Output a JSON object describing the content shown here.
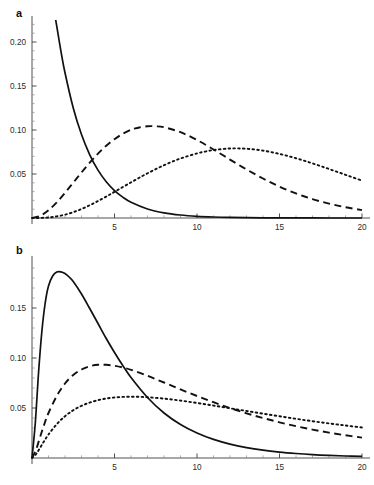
{
  "figure": {
    "width": 374,
    "height": 485,
    "background": "#ffffff",
    "curve_color": "#111111",
    "axis_color": "#3d3d3d"
  },
  "panels": {
    "a": {
      "label": "a"
    },
    "b": {
      "label": "b"
    }
  },
  "chart_data": [
    {
      "type": "line",
      "title": "a",
      "xlabel": "",
      "ylabel": "",
      "xlim": [
        0,
        20
      ],
      "ylim": [
        0,
        0.225
      ],
      "grid": false,
      "legend": "none",
      "xticks": [
        5,
        10,
        15,
        20
      ],
      "xticklabels": [
        "5",
        "10",
        "15",
        "20"
      ],
      "yticks": [
        0.05,
        0.1,
        0.15,
        0.2
      ],
      "yticklabels": [
        "0.05",
        "0.10",
        "0.15",
        "0.20"
      ],
      "x_minor_step": 1,
      "y_minor_step": 0.01,
      "series": [
        {
          "name": "solid",
          "style": "solid",
          "x": [
            0,
            0.25,
            0.5,
            0.75,
            1,
            1.25,
            1.4,
            1.5,
            1.75,
            2,
            2.5,
            3,
            3.5,
            4,
            4.5,
            5,
            5.5,
            6,
            7,
            8,
            9,
            10,
            11,
            12,
            13,
            14,
            15,
            16,
            17,
            18,
            19,
            20
          ],
          "y": [
            0.5,
            0.435,
            0.379,
            0.33,
            0.287,
            0.25,
            0.2295,
            0.218,
            0.19,
            0.165,
            0.125,
            0.0948,
            0.0718,
            0.0544,
            0.0412,
            0.0312,
            0.0237,
            0.0179,
            0.0103,
            0.0059,
            0.0034,
            0.00195,
            0.00112,
            0.00064,
            0.00037,
            0.00021,
            0.00012,
            7e-05,
            4e-05,
            2e-05,
            1e-05,
            1e-05
          ],
          "clipped_at_top": true,
          "visible_start_x": 1.4,
          "visible_start_y": 0.2135
        },
        {
          "name": "dashed",
          "style": "dashed",
          "x": [
            0,
            0.5,
            1,
            1.5,
            2,
            2.5,
            3,
            3.5,
            4,
            4.5,
            5,
            5.5,
            6,
            6.2,
            6.5,
            7,
            7.5,
            8,
            9,
            10,
            11,
            12,
            13,
            14,
            15,
            16,
            17,
            18,
            19,
            20
          ],
          "y": [
            0.0,
            0.0025,
            0.0088,
            0.0178,
            0.0286,
            0.0401,
            0.0518,
            0.0629,
            0.0731,
            0.0821,
            0.0896,
            0.0957,
            0.1003,
            0.1015,
            0.1029,
            0.1042,
            0.1042,
            0.1031,
            0.0975,
            0.0886,
            0.0779,
            0.0664,
            0.0552,
            0.0449,
            0.0357,
            0.0279,
            0.0215,
            0.0163,
            0.0122,
            0.009
          ],
          "peak_x": 6.1,
          "peak_y": 0.1136
        },
        {
          "name": "dotted",
          "style": "dotted",
          "x": [
            0,
            0.5,
            1,
            1.5,
            2,
            2.5,
            3,
            3.5,
            4,
            4.5,
            5,
            6,
            7,
            8,
            9,
            10,
            10.5,
            11,
            12,
            13,
            14,
            15,
            16,
            17,
            18,
            19,
            20
          ],
          "y": [
            0.0,
            0.0001,
            0.0006,
            0.0018,
            0.0038,
            0.0066,
            0.0102,
            0.0145,
            0.0193,
            0.0244,
            0.0297,
            0.0405,
            0.0508,
            0.06,
            0.0676,
            0.0734,
            0.0755,
            0.0772,
            0.079,
            0.0787,
            0.0766,
            0.0728,
            0.0679,
            0.0621,
            0.0557,
            0.0491,
            0.0425
          ],
          "peak_x": 10.3,
          "peak_y": 0.0886
        }
      ]
    },
    {
      "type": "line",
      "title": "b",
      "xlabel": "",
      "ylabel": "",
      "xlim": [
        0,
        20
      ],
      "ylim": [
        0,
        0.198
      ],
      "grid": false,
      "legend": "none",
      "xticks": [
        5,
        10,
        15,
        20
      ],
      "xticklabels": [
        "5",
        "10",
        "15",
        "20"
      ],
      "yticks": [
        0.05,
        0.1,
        0.15
      ],
      "yticklabels": [
        "0.05",
        "0.10",
        "0.15"
      ],
      "x_minor_step": 1,
      "y_minor_step": 0.01,
      "series": [
        {
          "name": "solid",
          "style": "solid",
          "x": [
            0,
            0.2,
            0.4,
            0.6,
            0.8,
            1,
            1.25,
            1.5,
            1.75,
            2,
            2.25,
            2.5,
            3,
            3.5,
            4,
            4.5,
            5,
            5.5,
            6,
            7,
            8,
            9,
            10,
            11,
            12,
            13,
            14,
            15,
            16,
            17,
            18,
            19,
            20
          ],
          "y": [
            0.0,
            0.035,
            0.086,
            0.127,
            0.155,
            0.172,
            0.182,
            0.186,
            0.1862,
            0.1845,
            0.181,
            0.1765,
            0.164,
            0.1495,
            0.1345,
            0.1195,
            0.1055,
            0.0925,
            0.0805,
            0.0605,
            0.045,
            0.0335,
            0.025,
            0.0186,
            0.0139,
            0.0104,
            0.0078,
            0.0059,
            0.0045,
            0.0034,
            0.0026,
            0.002,
            0.0016
          ],
          "peak_x": 1.85,
          "peak_y": 0.1862
        },
        {
          "name": "dashed",
          "style": "dashed",
          "x": [
            0,
            0.25,
            0.5,
            0.75,
            1,
            1.5,
            2,
            2.5,
            3,
            3.5,
            4,
            4.5,
            5,
            5.5,
            6,
            7,
            8,
            9,
            10,
            11,
            12,
            13,
            14,
            15,
            16,
            17,
            18,
            19,
            20
          ],
          "y": [
            0.0,
            0.0085,
            0.0215,
            0.034,
            0.045,
            0.062,
            0.0745,
            0.083,
            0.0885,
            0.0918,
            0.0932,
            0.0932,
            0.0922,
            0.0905,
            0.0882,
            0.0822,
            0.0755,
            0.0686,
            0.062,
            0.0558,
            0.05,
            0.0447,
            0.04,
            0.0357,
            0.0318,
            0.0284,
            0.0254,
            0.0227,
            0.0204
          ],
          "peak_x": 4.2,
          "peak_y": 0.0932
        },
        {
          "name": "dotted",
          "style": "dotted",
          "x": [
            0,
            0.25,
            0.5,
            0.75,
            1,
            1.5,
            2,
            2.5,
            3,
            3.5,
            4,
            4.5,
            5,
            5.5,
            6,
            6.5,
            7,
            8,
            9,
            10,
            11,
            12,
            13,
            14,
            15,
            16,
            17,
            18,
            19,
            20
          ],
          "y": [
            0.0,
            0.004,
            0.0105,
            0.0172,
            0.0235,
            0.0338,
            0.0418,
            0.0478,
            0.0522,
            0.0554,
            0.0578,
            0.0595,
            0.0605,
            0.0611,
            0.0613,
            0.0612,
            0.0608,
            0.0594,
            0.0574,
            0.055,
            0.0524,
            0.0497,
            0.047,
            0.0443,
            0.0417,
            0.0392,
            0.0368,
            0.0346,
            0.0325,
            0.0305
          ],
          "peak_x": 6.2,
          "peak_y": 0.0613
        }
      ]
    }
  ]
}
